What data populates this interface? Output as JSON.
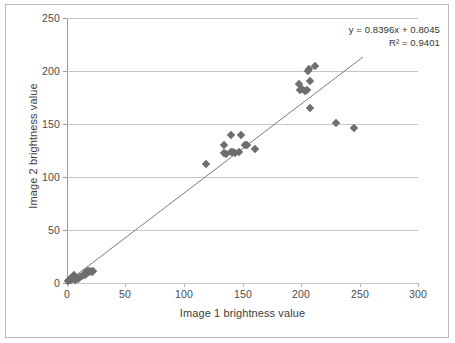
{
  "chart_data": {
    "type": "scatter",
    "title": "",
    "xlabel": "Image 1 brightness value",
    "ylabel": "Image 2 brightness value",
    "xlim": [
      0,
      300
    ],
    "ylim": [
      0,
      250
    ],
    "xticks": [
      0,
      50,
      100,
      150,
      200,
      250,
      300
    ],
    "yticks": [
      0,
      50,
      100,
      150,
      200,
      250
    ],
    "grid": "horizontal",
    "legend": "none",
    "marker_shape": "diamond",
    "marker_color": "#6e6e6e",
    "trendline": {
      "equation": "y = 0.8396x + 0.8045",
      "r_squared_label": "R² = 0.9401",
      "slope": 0.8396,
      "intercept": 0.8045,
      "r_squared": 0.9401,
      "color": "#7a7a7a",
      "x_start": 0,
      "x_end": 253
    },
    "points": [
      {
        "x": 1,
        "y": 2
      },
      {
        "x": 2,
        "y": 3
      },
      {
        "x": 3,
        "y": 3
      },
      {
        "x": 3,
        "y": 5
      },
      {
        "x": 4,
        "y": 4
      },
      {
        "x": 5,
        "y": 6
      },
      {
        "x": 6,
        "y": 8
      },
      {
        "x": 7,
        "y": 3
      },
      {
        "x": 8,
        "y": 5
      },
      {
        "x": 9,
        "y": 4
      },
      {
        "x": 11,
        "y": 6
      },
      {
        "x": 13,
        "y": 7
      },
      {
        "x": 15,
        "y": 8
      },
      {
        "x": 16,
        "y": 10
      },
      {
        "x": 17,
        "y": 9
      },
      {
        "x": 18,
        "y": 11
      },
      {
        "x": 19,
        "y": 10
      },
      {
        "x": 20,
        "y": 11
      },
      {
        "x": 21,
        "y": 10
      },
      {
        "x": 22,
        "y": 11
      },
      {
        "x": 119,
        "y": 112
      },
      {
        "x": 134,
        "y": 130
      },
      {
        "x": 134,
        "y": 123
      },
      {
        "x": 136,
        "y": 122
      },
      {
        "x": 140,
        "y": 140
      },
      {
        "x": 140,
        "y": 124
      },
      {
        "x": 142,
        "y": 124
      },
      {
        "x": 144,
        "y": 123
      },
      {
        "x": 147,
        "y": 124
      },
      {
        "x": 149,
        "y": 140
      },
      {
        "x": 152,
        "y": 130
      },
      {
        "x": 154,
        "y": 130
      },
      {
        "x": 161,
        "y": 126
      },
      {
        "x": 198,
        "y": 188
      },
      {
        "x": 199,
        "y": 182
      },
      {
        "x": 201,
        "y": 183
      },
      {
        "x": 203,
        "y": 181
      },
      {
        "x": 205,
        "y": 182
      },
      {
        "x": 206,
        "y": 200
      },
      {
        "x": 207,
        "y": 202
      },
      {
        "x": 208,
        "y": 165
      },
      {
        "x": 208,
        "y": 191
      },
      {
        "x": 212,
        "y": 205
      },
      {
        "x": 230,
        "y": 151
      },
      {
        "x": 245,
        "y": 146
      }
    ]
  },
  "axes": {
    "y_title": "Image 2 brightness value",
    "x_title": "Image 1 brightness value",
    "y_tick_labels": [
      "250",
      "200",
      "150",
      "100",
      "50",
      "0"
    ],
    "x_tick_labels": [
      "0",
      "50",
      "100",
      "150",
      "200",
      "250",
      "300"
    ]
  },
  "annotations": {
    "equation_line1": "y = 0.8396x + 0.8045",
    "equation_line2": "R² = 0.9401"
  },
  "colors": {
    "marker": "#6e6e6e",
    "trendline": "#7a7a7a",
    "gridline": "#c6c6c6",
    "axis": "#9a9a9a",
    "text": "#3d3d3d",
    "frame": "#b9b9b9"
  }
}
